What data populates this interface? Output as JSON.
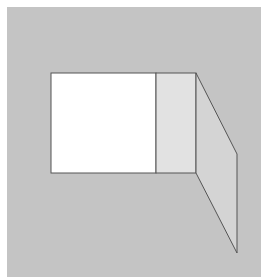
{
  "diagram": {
    "canvas": {
      "width": 263,
      "height": 280,
      "background": "#ffffff"
    },
    "colors": {
      "frame_fill": "#c4c4c4",
      "opening_fill": "#ffffff",
      "inner_panel_fill": "#e2e2e2",
      "flap_fill": "#d4d4d4",
      "stroke": "#555555"
    },
    "shapes": {
      "frame": {
        "x": 7,
        "y": 7,
        "width": 254,
        "height": 270
      },
      "opening": {
        "x": 51,
        "y": 73,
        "width": 105,
        "height": 100
      },
      "inner_panel": {
        "x": 156,
        "y": 73,
        "width": 40,
        "height": 100
      },
      "flap": {
        "points": "196,73 237,154 237,253 196,173"
      }
    }
  }
}
